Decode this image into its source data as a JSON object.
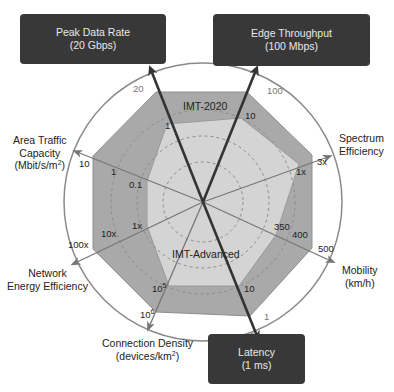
{
  "diagram": {
    "type": "radar-comparison",
    "series": [
      {
        "name": "IMT-2020",
        "fill": "#a9a9a9"
      },
      {
        "name": "IMT-Advanced",
        "fill": "#d4d4d4"
      }
    ],
    "highlight_boxes": [
      {
        "id": "peak",
        "title": "Peak Data Rate",
        "value": "(20 Gbps)"
      },
      {
        "id": "edge",
        "title": "Edge Throughput",
        "value": "(100 Mbps)"
      },
      {
        "id": "latency",
        "title": "Latency",
        "value": "(1 ms)"
      }
    ],
    "axes": [
      {
        "id": "area",
        "label_lines": [
          "Area Traffic",
          "Capacity",
          "(Mbit/s/m",
          "2",
          ")"
        ],
        "ticks": [
          "10",
          "1",
          "0.1"
        ]
      },
      {
        "id": "spectrum",
        "label_lines": [
          "Spectrum",
          "Efficiency"
        ],
        "ticks": [
          "3x",
          "1x"
        ]
      },
      {
        "id": "energy",
        "label_lines": [
          "Network",
          "Energy Efficiency"
        ],
        "ticks": [
          "100x",
          "10x",
          "1x"
        ]
      },
      {
        "id": "mobility",
        "label_lines": [
          "Mobility",
          "(km/h)"
        ],
        "ticks": [
          "500",
          "400",
          "350"
        ]
      },
      {
        "id": "connection",
        "label_lines": [
          "Connection Density",
          "(devices/km",
          "2",
          ")"
        ],
        "ticks": [
          "10",
          "6",
          "10",
          "5"
        ]
      },
      {
        "id": "peak",
        "ticks": [
          "20",
          "1"
        ]
      },
      {
        "id": "edge",
        "ticks": [
          "100",
          "10"
        ]
      },
      {
        "id": "latency",
        "ticks": [
          "1",
          "10"
        ]
      }
    ],
    "colors": {
      "box_bg": "#383838",
      "box_text": "#e8e8e8",
      "outer_fill": "#a9a9a9",
      "inner_fill": "#d4d4d4",
      "axis_line": "#6f6f6f",
      "highlight_arrow": "#333333",
      "circle": "#8a8a8a"
    }
  }
}
